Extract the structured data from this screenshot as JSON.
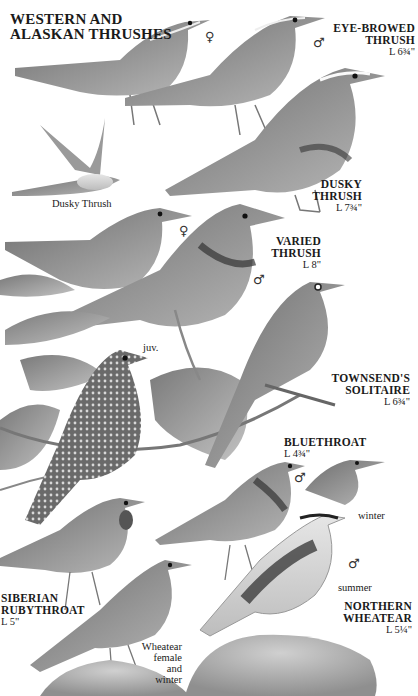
{
  "plate": {
    "title_line1": "WESTERN AND",
    "title_line2": "ALASKAN THRUSHES",
    "palette": {
      "ink": "#1a1a1a",
      "bird_dark": "#5a5a5a",
      "bird_mid": "#8c8c8c",
      "bird_light": "#c8c8c8",
      "leaf": "#9a9a9a",
      "rock": "#b5b5b5",
      "background": "#ffffff"
    }
  },
  "species": [
    {
      "id": "eye-browed-thrush",
      "name_line1": "EYE-BROWED",
      "name_line2": "THRUSH",
      "length": "L 6¾\"",
      "sexes": [
        "♀",
        "♂"
      ]
    },
    {
      "id": "dusky-thrush",
      "name_line1": "DUSKY",
      "name_line2": "THRUSH",
      "length": "L 7¾\"",
      "flight_caption": "Dusky Thrush"
    },
    {
      "id": "varied-thrush",
      "name_line1": "VARIED",
      "name_line2": "THRUSH",
      "length": "L 8\"",
      "sexes": [
        "♀",
        "♂"
      ],
      "juvenile_caption": "juv."
    },
    {
      "id": "townsends-solitaire",
      "name_line1": "TOWNSEND'S",
      "name_line2": "SOLITAIRE",
      "length": "L 6¾\""
    },
    {
      "id": "bluethroat",
      "name_line1": "BLUETHROAT",
      "length": "L 4¾\"",
      "sexes": [
        "♂"
      ],
      "season_caption": "winter"
    },
    {
      "id": "siberian-rubythroat",
      "name_line1": "SIBERIAN",
      "name_line2": "RUBYTHROAT",
      "length": "L 5\""
    },
    {
      "id": "northern-wheatear",
      "name_line1": "NORTHERN",
      "name_line2": "WHEATEAR",
      "length": "L 5¼\"",
      "sexes": [
        "♂"
      ],
      "season_caption": "summer",
      "female_caption_line1": "Wheatear",
      "female_caption_line2": "female and",
      "female_caption_line3": "winter"
    }
  ]
}
